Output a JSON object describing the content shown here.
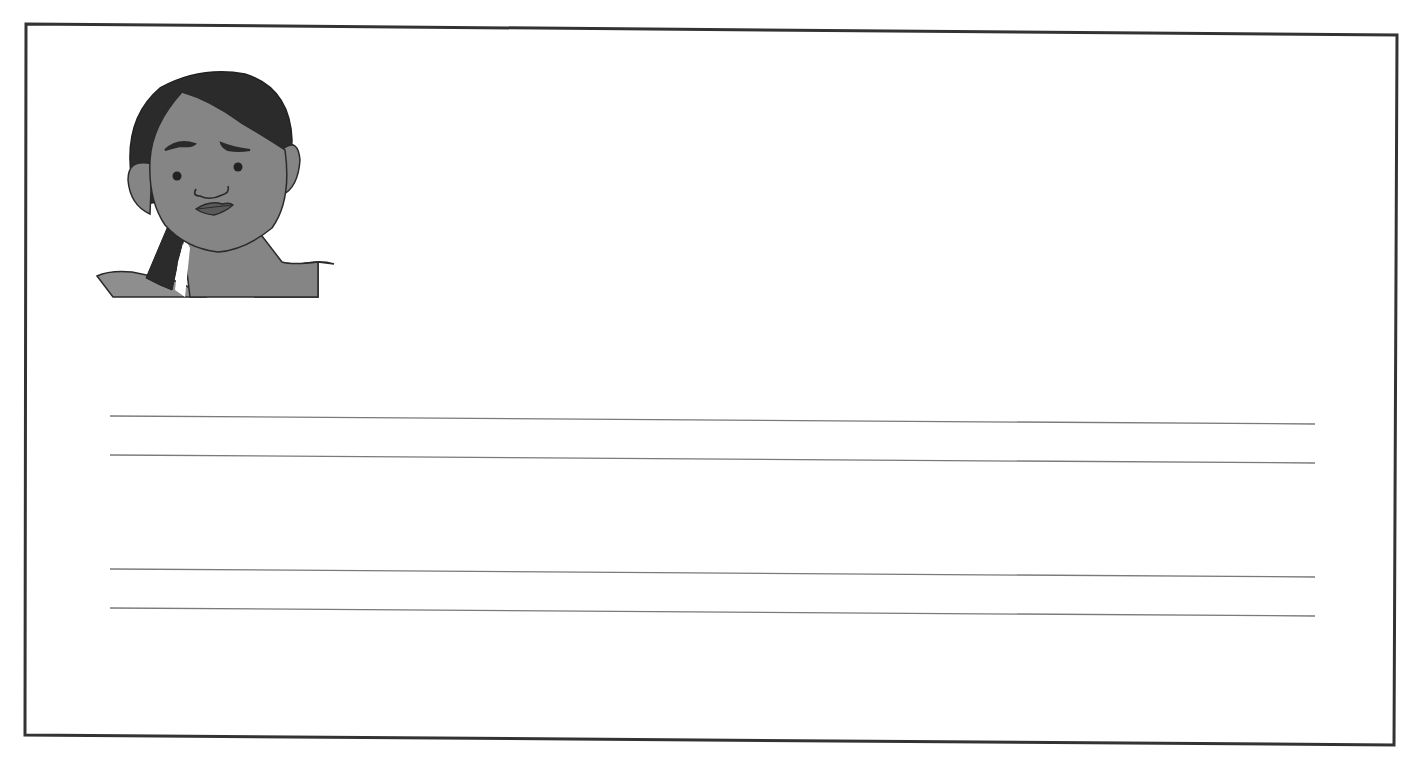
{
  "worksheet": {
    "frame": {
      "corners": {
        "top_left": [
          26,
          24
        ],
        "top_right": [
          1397,
          35
        ],
        "bottom_right": [
          1394,
          745
        ],
        "bottom_left": [
          25,
          735
        ]
      },
      "stroke_color": "#333333",
      "stroke_width": 3
    },
    "illustration": {
      "subject": "girl-with-worried-expression",
      "colors": {
        "skin": "#858585",
        "hair": "#2b2b2b",
        "outline": "#2a2a2a",
        "clothing": "#8e8e8e"
      }
    },
    "writing_lines": [
      {
        "x1": 110,
        "y1": 416,
        "x2": 1315,
        "y2": 424
      },
      {
        "x1": 110,
        "y1": 455,
        "x2": 1315,
        "y2": 463
      },
      {
        "x1": 110,
        "y1": 569,
        "x2": 1315,
        "y2": 577
      },
      {
        "x1": 110,
        "y1": 608,
        "x2": 1315,
        "y2": 616
      }
    ],
    "line_color": "#7a7a7a"
  }
}
